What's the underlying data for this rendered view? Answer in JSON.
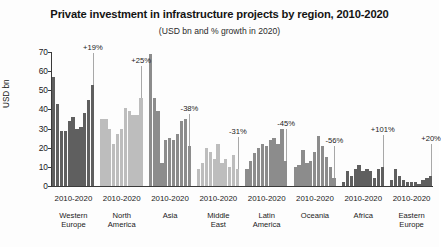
{
  "chart_data": {
    "type": "bar",
    "title": "Private investment in infrastructure projects by region, 2010-2020",
    "subtitle": "(USD bn and % growth in 2020)",
    "xlabel": "",
    "ylabel": "USD bn",
    "ylim": [
      0,
      70
    ],
    "yticks": [
      0,
      10,
      20,
      30,
      40,
      50,
      60,
      70
    ],
    "ytick_labels": [
      "0",
      "10",
      "20",
      "30",
      "40",
      "50",
      "60",
      "70"
    ],
    "grid": false,
    "legend": "none",
    "x": [
      "2010",
      "2011",
      "2012",
      "2013",
      "2014",
      "2015",
      "2016",
      "2017",
      "2018",
      "2019",
      "2020"
    ],
    "period_label": "2010-2020",
    "groups": [
      {
        "region": "Western Europe",
        "region_lines": [
          "Western",
          "Europe"
        ],
        "range_label": "2010-2020",
        "annotation": "+19%",
        "shade": "dark",
        "values": [
          57,
          43,
          29,
          29,
          34,
          36,
          30,
          31,
          38,
          45,
          53
        ]
      },
      {
        "region": "North America",
        "region_lines": [
          "North",
          "America"
        ],
        "range_label": "2010-2020",
        "annotation": "+25%",
        "shade": "light",
        "values": [
          35,
          35,
          30,
          22,
          27,
          30,
          41,
          39,
          37,
          37,
          46
        ]
      },
      {
        "region": "Asia",
        "region_lines": [
          "Asia"
        ],
        "range_label": "2010-2020",
        "annotation": "-38%",
        "shade": "mid",
        "values": [
          69,
          46,
          39,
          12,
          24,
          25,
          24,
          27,
          34,
          35,
          21
        ]
      },
      {
        "region": "Middle East",
        "region_lines": [
          "Middle",
          "East"
        ],
        "range_label": "2010-2020",
        "annotation": "-31%",
        "shade": "light",
        "values": [
          9,
          12,
          20,
          18,
          14,
          22,
          12,
          14,
          10,
          16,
          9
        ]
      },
      {
        "region": "Latin America",
        "region_lines": [
          "Latin",
          "America"
        ],
        "range_label": "2010-2020",
        "annotation": "-45%",
        "shade": "mid",
        "values": [
          9,
          13,
          17,
          20,
          22,
          21,
          24,
          25,
          22,
          30,
          13
        ]
      },
      {
        "region": "Oceania",
        "region_lines": [
          "Oceania"
        ],
        "range_label": "2010-2020",
        "annotation": "-56%",
        "shade": "mid",
        "values": [
          10,
          11,
          19,
          12,
          13,
          18,
          26,
          21,
          15,
          10,
          4
        ]
      },
      {
        "region": "Africa",
        "region_lines": [
          "Africa"
        ],
        "range_label": "2010-2020",
        "annotation": "+101%",
        "shade": "dark",
        "values": [
          2,
          8,
          5,
          9,
          11,
          8,
          9,
          8,
          4,
          9,
          10
        ]
      },
      {
        "region": "Eastern Europe",
        "region_lines": [
          "Eastern",
          "Europe"
        ],
        "range_label": "2010-2020",
        "annotation": "+20%",
        "shade": "dark",
        "values": [
          3,
          9,
          5,
          3,
          2,
          2,
          2,
          1,
          3,
          4,
          5
        ]
      }
    ]
  }
}
